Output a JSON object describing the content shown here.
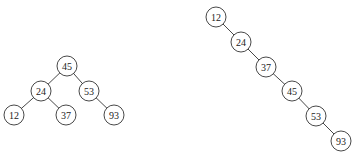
{
  "diagram": {
    "type": "binary-search-trees",
    "node_radius": 10,
    "colors": {
      "stroke": "#333333",
      "fill": "#ffffff",
      "text": "#222222"
    },
    "trees": [
      {
        "name": "balanced-bst",
        "nodes": [
          {
            "id": "L45",
            "label": "45",
            "x": 67,
            "y": 66
          },
          {
            "id": "L24",
            "label": "24",
            "x": 41,
            "y": 91
          },
          {
            "id": "L53",
            "label": "53",
            "x": 89,
            "y": 91
          },
          {
            "id": "L12",
            "label": "12",
            "x": 14,
            "y": 115
          },
          {
            "id": "L37",
            "label": "37",
            "x": 66,
            "y": 115
          },
          {
            "id": "L93",
            "label": "93",
            "x": 114,
            "y": 115
          }
        ],
        "edges": [
          [
            "L45",
            "L24"
          ],
          [
            "L45",
            "L53"
          ],
          [
            "L24",
            "L12"
          ],
          [
            "L24",
            "L37"
          ],
          [
            "L53",
            "L93"
          ]
        ]
      },
      {
        "name": "degenerate-bst",
        "nodes": [
          {
            "id": "R12",
            "label": "12",
            "x": 216,
            "y": 17
          },
          {
            "id": "R24",
            "label": "24",
            "x": 241,
            "y": 42
          },
          {
            "id": "R37",
            "label": "37",
            "x": 266,
            "y": 67
          },
          {
            "id": "R45",
            "label": "45",
            "x": 292,
            "y": 91
          },
          {
            "id": "R53",
            "label": "53",
            "x": 316,
            "y": 116
          },
          {
            "id": "R93",
            "label": "93",
            "x": 341,
            "y": 141
          }
        ],
        "edges": [
          [
            "R12",
            "R24"
          ],
          [
            "R24",
            "R37"
          ],
          [
            "R37",
            "R45"
          ],
          [
            "R45",
            "R53"
          ],
          [
            "R53",
            "R93"
          ]
        ]
      }
    ]
  }
}
